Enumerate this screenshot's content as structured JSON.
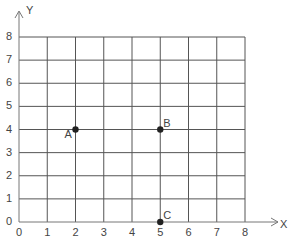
{
  "chart_data": {
    "type": "scatter",
    "title": "",
    "xlabel": "X",
    "ylabel": "Y",
    "xlim": [
      0,
      8
    ],
    "ylim": [
      0,
      8
    ],
    "grid": true,
    "x_ticks": [
      "0",
      "1",
      "2",
      "3",
      "4",
      "5",
      "6",
      "7",
      "8"
    ],
    "y_ticks": [
      "0",
      "1",
      "2",
      "3",
      "4",
      "5",
      "6",
      "7",
      "8"
    ],
    "points": [
      {
        "label": "A",
        "x": 2,
        "y": 4
      },
      {
        "label": "B",
        "x": 5,
        "y": 4
      },
      {
        "label": "C",
        "x": 5,
        "y": 0
      }
    ]
  },
  "colors": {
    "grid": "#555555",
    "axis": "#666666",
    "point": "#222222",
    "text": "#444444"
  }
}
